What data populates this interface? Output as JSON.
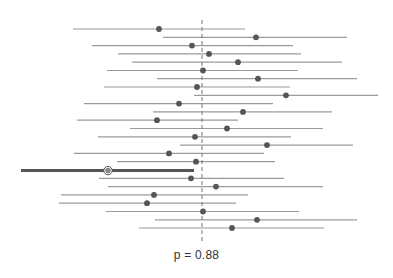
{
  "chart_data": {
    "type": "forest",
    "title": "",
    "annotation": "p = 0.88",
    "xlabel": "",
    "ylabel": "",
    "grid": false,
    "legend": null,
    "reference_line": {
      "style": "dashed",
      "x_px": 202,
      "y_top_px": 20,
      "y_bottom_px": 243,
      "color": "#777777"
    },
    "colors": {
      "interval_line": "#9a9a9a",
      "point": "#555555",
      "highlight_line": "#555555",
      "highlight_point_fill": "#8a8a8a",
      "highlight_point_stroke": "#555555",
      "reference_line": "#777777"
    },
    "rows": [
      {
        "index": 1,
        "y": 29,
        "lower": 73,
        "estimate": 159,
        "upper": 245,
        "highlight": false
      },
      {
        "index": 2,
        "y": 37.3,
        "lower": 163,
        "estimate": 256,
        "upper": 347,
        "highlight": false
      },
      {
        "index": 3,
        "y": 45.6,
        "lower": 92,
        "estimate": 192,
        "upper": 293,
        "highlight": false
      },
      {
        "index": 4,
        "y": 53.9,
        "lower": 118,
        "estimate": 209,
        "upper": 301,
        "highlight": false
      },
      {
        "index": 5,
        "y": 62.2,
        "lower": 132,
        "estimate": 238,
        "upper": 342,
        "highlight": false
      },
      {
        "index": 6,
        "y": 70.5,
        "lower": 107,
        "estimate": 203,
        "upper": 298,
        "highlight": false
      },
      {
        "index": 7,
        "y": 78.7,
        "lower": 157,
        "estimate": 258,
        "upper": 357,
        "highlight": false
      },
      {
        "index": 8,
        "y": 87,
        "lower": 104,
        "estimate": 197,
        "upper": 290,
        "highlight": false
      },
      {
        "index": 9,
        "y": 95.3,
        "lower": 194,
        "estimate": 286,
        "upper": 378,
        "highlight": false
      },
      {
        "index": 10,
        "y": 103.6,
        "lower": 84,
        "estimate": 179,
        "upper": 273,
        "highlight": false
      },
      {
        "index": 11,
        "y": 111.9,
        "lower": 153,
        "estimate": 243,
        "upper": 332,
        "highlight": false
      },
      {
        "index": 12,
        "y": 120.2,
        "lower": 77,
        "estimate": 157,
        "upper": 238,
        "highlight": false
      },
      {
        "index": 13,
        "y": 128.5,
        "lower": 130,
        "estimate": 227,
        "upper": 323,
        "highlight": false
      },
      {
        "index": 14,
        "y": 136.8,
        "lower": 98,
        "estimate": 195,
        "upper": 291,
        "highlight": false
      },
      {
        "index": 15,
        "y": 145.1,
        "lower": 180,
        "estimate": 267,
        "upper": 353,
        "highlight": false
      },
      {
        "index": 16,
        "y": 153.4,
        "lower": 74,
        "estimate": 169,
        "upper": 264,
        "highlight": false
      },
      {
        "index": 17,
        "y": 161.7,
        "lower": 117,
        "estimate": 196,
        "upper": 275,
        "highlight": false
      },
      {
        "index": 18,
        "y": 170.6,
        "lower": 21,
        "estimate": 108,
        "upper": 194,
        "highlight": true
      },
      {
        "index": 19,
        "y": 178.3,
        "lower": 99,
        "estimate": 191,
        "upper": 284,
        "highlight": false
      },
      {
        "index": 20,
        "y": 186.6,
        "lower": 108,
        "estimate": 216,
        "upper": 323,
        "highlight": false
      },
      {
        "index": 21,
        "y": 194.9,
        "lower": 61,
        "estimate": 154,
        "upper": 248,
        "highlight": false
      },
      {
        "index": 22,
        "y": 203.2,
        "lower": 59,
        "estimate": 147,
        "upper": 236,
        "highlight": false
      },
      {
        "index": 23,
        "y": 211.5,
        "lower": 106,
        "estimate": 203,
        "upper": 299,
        "highlight": false
      },
      {
        "index": 24,
        "y": 219.8,
        "lower": 155,
        "estimate": 257,
        "upper": 357,
        "highlight": false
      },
      {
        "index": 25,
        "y": 228,
        "lower": 139,
        "estimate": 232,
        "upper": 324,
        "highlight": false
      }
    ],
    "units": "pixel coordinates (no axis ticks shown)"
  },
  "labels": {
    "pvalue": "p = 0.88"
  }
}
